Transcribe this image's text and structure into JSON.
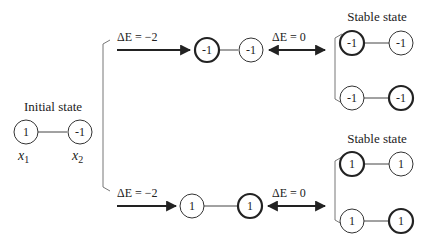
{
  "colors": {
    "ink": "#222222",
    "bracket": "#777777",
    "background": "#ffffff"
  },
  "initial": {
    "title": "Initial state",
    "nodes": [
      {
        "value": "1",
        "var": "x",
        "sub": "1"
      },
      {
        "value": "-1",
        "var": "x",
        "sub": "2"
      }
    ]
  },
  "top_branch": {
    "step1_label": "ΔE = −2",
    "intermediate": [
      {
        "value": "-1",
        "bold": true
      },
      {
        "value": "-1",
        "bold": false
      }
    ],
    "step2_label": "ΔE = 0",
    "stable_title": "Stable state",
    "stable": [
      [
        {
          "value": "-1",
          "bold": true
        },
        {
          "value": "-1",
          "bold": false
        }
      ],
      [
        {
          "value": "-1",
          "bold": false
        },
        {
          "value": "-1",
          "bold": true
        }
      ]
    ]
  },
  "bottom_branch": {
    "step1_label": "ΔE = −2",
    "intermediate": [
      {
        "value": "1",
        "bold": false
      },
      {
        "value": "1",
        "bold": true
      }
    ],
    "step2_label": "ΔE = 0",
    "stable_title": "Stable state",
    "stable": [
      [
        {
          "value": "1",
          "bold": true
        },
        {
          "value": "1",
          "bold": false
        }
      ],
      [
        {
          "value": "1",
          "bold": false
        },
        {
          "value": "1",
          "bold": true
        }
      ]
    ]
  }
}
